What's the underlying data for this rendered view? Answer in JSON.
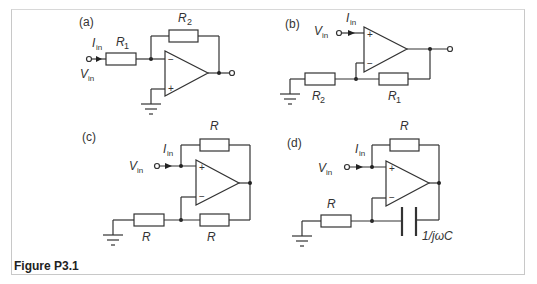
{
  "figure": {
    "caption": "Figure P3.1",
    "panels": [
      {
        "id": "a",
        "label": "(a)",
        "input_current": "I",
        "input_current_sub": "in",
        "input_voltage": "V",
        "input_voltage_sub": "in",
        "components": [
          {
            "name": "R",
            "sub": "1",
            "role": "input resistor"
          },
          {
            "name": "R",
            "sub": "2",
            "role": "feedback resistor"
          }
        ],
        "opamp_inputs": {
          "top": "−",
          "bottom": "+"
        }
      },
      {
        "id": "b",
        "label": "(b)",
        "input_current": "I",
        "input_current_sub": "in",
        "input_voltage": "V",
        "input_voltage_sub": "in",
        "components": [
          {
            "name": "R",
            "sub": "2",
            "role": "resistor to ground"
          },
          {
            "name": "R",
            "sub": "1",
            "role": "feedback resistor"
          }
        ],
        "opamp_inputs": {
          "top": "+",
          "bottom": "−"
        }
      },
      {
        "id": "c",
        "label": "(c)",
        "input_current": "I",
        "input_current_sub": "in",
        "input_voltage": "V",
        "input_voltage_sub": "in",
        "components": [
          {
            "name": "R",
            "sub": "",
            "role": "positive feedback resistor"
          },
          {
            "name": "R",
            "sub": "",
            "role": "resistor to ground"
          },
          {
            "name": "R",
            "sub": "",
            "role": "negative feedback resistor"
          }
        ],
        "opamp_inputs": {
          "top": "+",
          "bottom": "−"
        }
      },
      {
        "id": "d",
        "label": "(d)",
        "input_current": "I",
        "input_current_sub": "in",
        "input_voltage": "V",
        "input_voltage_sub": "in",
        "components": [
          {
            "name": "R",
            "sub": "",
            "role": "positive feedback resistor"
          },
          {
            "name": "R",
            "sub": "",
            "role": "resistor to ground"
          },
          {
            "name": "1/jωC",
            "sub": "",
            "role": "feedback capacitor"
          }
        ],
        "opamp_inputs": {
          "top": "+",
          "bottom": "−"
        }
      }
    ]
  }
}
